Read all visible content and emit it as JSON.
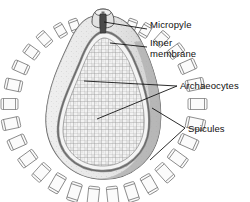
{
  "figure": {
    "background_color": "#ffffff",
    "line_color": "#4d4d4d",
    "fill_light": "#ededed",
    "fill_mid": "#d9d9d9",
    "fill_dark": "#b9b9b9",
    "text_color": "#111111"
  },
  "labels": [
    {
      "id": "micropyle",
      "text": "Micropyle",
      "x": 150,
      "y": 25
    },
    {
      "id": "inner",
      "text": "Inner",
      "x": 150,
      "y": 43
    },
    {
      "id": "membrane",
      "text": "membrane",
      "x": 150,
      "y": 54
    },
    {
      "id": "archaeocytes",
      "text": "Archaeocytes",
      "x": 180,
      "y": 89
    },
    {
      "id": "spicules",
      "text": "Spicules",
      "x": 188,
      "y": 131
    }
  ],
  "structures": [
    {
      "id": "micropyle",
      "name": "Micropyle",
      "description": "dark apical opening slot at top neck"
    },
    {
      "id": "inner-membrane",
      "name": "Inner membrane",
      "description": "pale inner wall lining beneath the cortex"
    },
    {
      "id": "archaeocytes",
      "name": "Archaeocytes",
      "description": "dense granular mass of totipotent cells filling the interior"
    },
    {
      "id": "spicules",
      "name": "Spicules",
      "description": "radial amphidisc spicules forming the outer fringe"
    }
  ],
  "leaders": [
    {
      "id": "leader-micropyle",
      "target": "micropyle"
    },
    {
      "id": "leader-inner-membrane",
      "target": "inner-membrane"
    },
    {
      "id": "leader-archaeocytes-upper",
      "target": "archaeocytes"
    },
    {
      "id": "leader-archaeocytes-lower",
      "target": "archaeocytes"
    },
    {
      "id": "leader-spicules-upper",
      "target": "spicules"
    },
    {
      "id": "leader-spicules-lower",
      "target": "spicules"
    }
  ]
}
